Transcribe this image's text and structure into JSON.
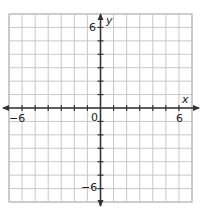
{
  "chart_data": {
    "type": "scatter",
    "title": "",
    "xlabel": "x",
    "ylabel": "y",
    "xlim": [
      -7,
      7
    ],
    "ylim": [
      -7,
      7
    ],
    "grid": true,
    "grid_step": 1,
    "x_tick_labels": [
      "-6",
      "0",
      "6"
    ],
    "y_tick_labels": [
      "6",
      "-6"
    ],
    "origin_label": "0",
    "points": [],
    "series": []
  },
  "labels": {
    "x_axis_name": "x",
    "y_axis_name": "y",
    "x_neg": "−6",
    "x_pos": "6",
    "y_pos": "6",
    "y_neg": "−6",
    "origin": "0"
  },
  "colors": {
    "grid": "#c8c8c8",
    "border": "#bdbdbd",
    "axis": "#333333"
  }
}
